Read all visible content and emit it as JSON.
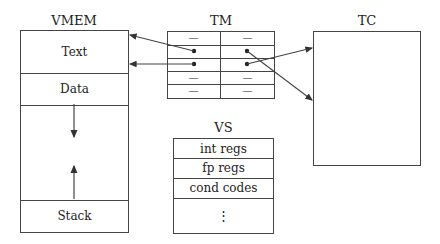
{
  "vmem": {
    "title": "VMEM",
    "segments": [
      {
        "label": "Text"
      },
      {
        "label": "Data"
      },
      {
        "label": ""
      },
      {
        "label": "Stack"
      }
    ]
  },
  "tm": {
    "title": "TM",
    "rows": [
      {
        "left": "—",
        "right": "—"
      },
      {
        "left": "•",
        "right": "•"
      },
      {
        "left": "•",
        "right": "•"
      },
      {
        "left": "—",
        "right": "—"
      },
      {
        "left": "—",
        "right": "—"
      }
    ]
  },
  "tc": {
    "title": "TC"
  },
  "vs": {
    "title": "VS",
    "rows": [
      {
        "label": "int regs"
      },
      {
        "label": "fp regs"
      },
      {
        "label": "cond codes"
      },
      {
        "label": "⋮"
      }
    ]
  },
  "arrows": [
    {
      "from": "tm.row1.left",
      "to": "vmem.text.top"
    },
    {
      "from": "tm.row2.left",
      "to": "vmem.text.bottom"
    },
    {
      "from": "tm.row1.right",
      "to": "tc.lower"
    },
    {
      "from": "tm.row2.right",
      "to": "tc.upper"
    }
  ],
  "colors": {
    "line": "#444444",
    "text": "#222222",
    "background": "#ffffff"
  }
}
